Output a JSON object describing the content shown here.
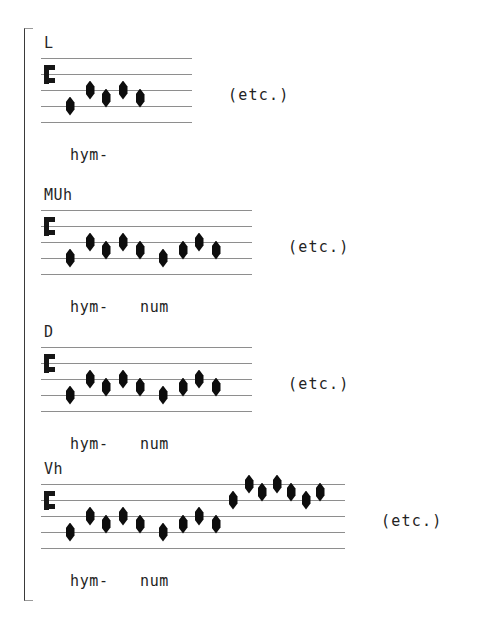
{
  "figure": {
    "kind": "mensural-chant-transcription",
    "bracket_present": true,
    "ink_color": "#0d0d0d",
    "staff_line_color": "#8e8e8e"
  },
  "staff_geometry": {
    "line_count": 5,
    "line_spacing_px": 16,
    "note_width_px": 9,
    "note_height_px": 19,
    "clef_name": "c-clef",
    "clef_line_index": 2
  },
  "systems": [
    {
      "label": "L",
      "label_x": 44,
      "label_y": 36,
      "staff_top": 58,
      "staff_left": 41,
      "staff_width": 151,
      "clef_x": 44,
      "clef_center_line": 2,
      "etc_text": "(etc.)",
      "etc_x": 228,
      "etc_y": 88,
      "lyrics": [
        {
          "text": "hym-",
          "x": 70,
          "y": 148
        }
      ],
      "note_groups": [
        {
          "syllable": "hym-",
          "notes": [
            {
              "x": 70,
              "position": 4.0
            },
            {
              "x": 90,
              "position": 3.0
            },
            {
              "x": 106,
              "position": 3.5
            },
            {
              "x": 123,
              "position": 3.0
            },
            {
              "x": 140,
              "position": 3.5
            }
          ]
        }
      ]
    },
    {
      "label": "MUh",
      "label_x": 44,
      "label_y": 188,
      "staff_top": 210,
      "staff_left": 41,
      "staff_width": 211,
      "clef_x": 44,
      "clef_center_line": 2,
      "etc_text": "(etc.)",
      "etc_x": 288,
      "etc_y": 240,
      "lyrics": [
        {
          "text": "hym-",
          "x": 70,
          "y": 300
        },
        {
          "text": "num",
          "x": 140,
          "y": 300
        }
      ],
      "note_groups": [
        {
          "syllable": "hym-",
          "notes": [
            {
              "x": 70,
              "position": 4.0
            },
            {
              "x": 90,
              "position": 3.0
            },
            {
              "x": 106,
              "position": 3.5
            },
            {
              "x": 123,
              "position": 3.0
            },
            {
              "x": 140,
              "position": 3.5
            }
          ]
        },
        {
          "syllable": "num",
          "notes": [
            {
              "x": 163,
              "position": 4.0
            },
            {
              "x": 183,
              "position": 3.5
            },
            {
              "x": 199,
              "position": 3.0
            },
            {
              "x": 216,
              "position": 3.5
            }
          ]
        }
      ]
    },
    {
      "label": "D",
      "label_x": 44,
      "label_y": 325,
      "staff_top": 347,
      "staff_left": 41,
      "staff_width": 211,
      "clef_x": 44,
      "clef_center_line": 2,
      "etc_text": "(etc.)",
      "etc_x": 288,
      "etc_y": 377,
      "lyrics": [
        {
          "text": "hym-",
          "x": 70,
          "y": 437
        },
        {
          "text": "num",
          "x": 140,
          "y": 437
        }
      ],
      "note_groups": [
        {
          "syllable": "hym-",
          "notes": [
            {
              "x": 70,
              "position": 4.0
            },
            {
              "x": 90,
              "position": 3.0
            },
            {
              "x": 106,
              "position": 3.5
            },
            {
              "x": 123,
              "position": 3.0
            },
            {
              "x": 140,
              "position": 3.5
            }
          ]
        },
        {
          "syllable": "num",
          "notes": [
            {
              "x": 163,
              "position": 4.0
            },
            {
              "x": 183,
              "position": 3.5
            },
            {
              "x": 199,
              "position": 3.0
            },
            {
              "x": 216,
              "position": 3.5
            }
          ]
        }
      ]
    },
    {
      "label": "Vh",
      "label_x": 44,
      "label_y": 462,
      "staff_top": 484,
      "staff_left": 41,
      "staff_width": 304,
      "clef_x": 44,
      "clef_center_line": 2,
      "etc_text": "(etc.)",
      "etc_x": 381,
      "etc_y": 514,
      "lyrics": [
        {
          "text": "hym-",
          "x": 70,
          "y": 574
        },
        {
          "text": "num",
          "x": 140,
          "y": 574
        }
      ],
      "note_groups": [
        {
          "syllable": "hym-",
          "notes": [
            {
              "x": 70,
              "position": 4.0
            },
            {
              "x": 90,
              "position": 3.0
            },
            {
              "x": 106,
              "position": 3.5
            },
            {
              "x": 123,
              "position": 3.0
            },
            {
              "x": 140,
              "position": 3.5
            }
          ]
        },
        {
          "syllable": "num",
          "notes": [
            {
              "x": 163,
              "position": 4.0
            },
            {
              "x": 183,
              "position": 3.5
            },
            {
              "x": 199,
              "position": 3.0
            },
            {
              "x": 216,
              "position": 3.5
            }
          ]
        },
        {
          "syllable": "",
          "notes": [
            {
              "x": 233,
              "position": 2.0
            },
            {
              "x": 249,
              "position": 1.0
            },
            {
              "x": 262,
              "position": 1.5
            },
            {
              "x": 277,
              "position": 1.0
            },
            {
              "x": 291,
              "position": 1.5
            },
            {
              "x": 306,
              "position": 2.0
            },
            {
              "x": 320,
              "position": 1.5
            }
          ]
        }
      ]
    }
  ]
}
